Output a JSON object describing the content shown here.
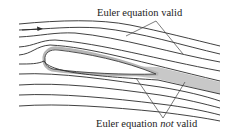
{
  "diagram": {
    "labels": {
      "valid": "Euler equation valid",
      "not_valid_prefix": "Euler equation ",
      "not_valid_emphasis": "not",
      "not_valid_suffix": " valid"
    },
    "colors": {
      "streamline": "#2b2b2b",
      "wake_fill": "#c8c8c8",
      "airfoil_edge": "#9a9a9a",
      "pointer": "#444444"
    },
    "elements": {
      "streamline_count": 10,
      "flow_direction_arrow": "right",
      "airfoil": "airfoil body with boundary layer",
      "wake": "shaded viscous wake region"
    }
  }
}
